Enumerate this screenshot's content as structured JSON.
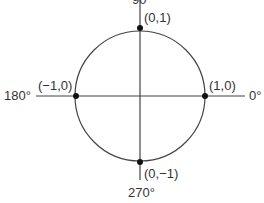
{
  "diagram": {
    "angle_labels": {
      "top": "90°",
      "left": "180°",
      "right": "0°",
      "bottom": "270°"
    },
    "points": [
      {
        "name": "top",
        "label": "(0,1)"
      },
      {
        "name": "left",
        "label": "(−1,0)"
      },
      {
        "name": "right",
        "label": "(1,0)"
      },
      {
        "name": "bottom",
        "label": "(0,−1)"
      }
    ],
    "colors": {
      "stroke": "#333333",
      "point": "#111111"
    }
  }
}
